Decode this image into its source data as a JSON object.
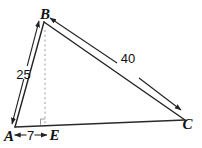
{
  "diagram": {
    "kind": "geometry-triangle-with-altitude",
    "vertex_labels": {
      "a": "A",
      "b": "B",
      "c": "C",
      "e": "E"
    },
    "side_lengths": {
      "ab": "25",
      "bc": "40",
      "ae": "7"
    },
    "colors": {
      "line": "#222222",
      "guide_gray": "#9a9a9a",
      "text": "#111111",
      "background": "#ffffff"
    }
  }
}
